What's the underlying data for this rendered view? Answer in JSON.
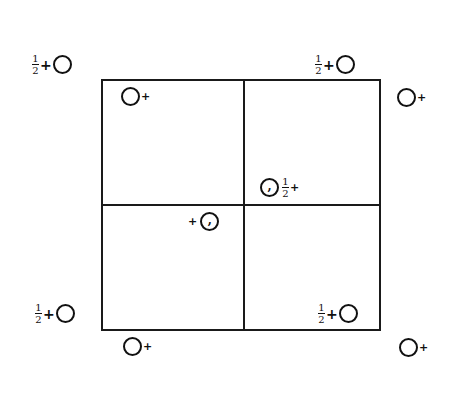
{
  "diagram": {
    "cell": {
      "x": 101,
      "y": 80,
      "width": 279,
      "height": 250,
      "divider_x": 243,
      "divider_y": 205
    },
    "symbols": [
      {
        "id": "tl-outer",
        "fraction": {
          "num": "1",
          "den": "2"
        },
        "sign": "+",
        "comma": false,
        "order": "frac-sign-circle"
      },
      {
        "id": "tl-inner",
        "sign": "+",
        "comma": false,
        "order": "circle-sign"
      },
      {
        "id": "tr-top",
        "fraction": {
          "num": "1",
          "den": "2"
        },
        "sign": "+",
        "comma": false,
        "order": "frac-sign-circle"
      },
      {
        "id": "tr-outer",
        "sign": "+",
        "comma": false,
        "order": "circle-sign"
      },
      {
        "id": "center-upper",
        "fraction": {
          "num": "1",
          "den": "2"
        },
        "sign": "+",
        "comma": true,
        "comma_glyph": ",",
        "order": "circle-frac-sign"
      },
      {
        "id": "center-lower",
        "sign": "+",
        "comma": true,
        "comma_glyph": ",",
        "order": "sign-circle"
      },
      {
        "id": "bl-outer",
        "fraction": {
          "num": "1",
          "den": "2"
        },
        "sign": "+",
        "comma": false,
        "order": "frac-sign-circle"
      },
      {
        "id": "bl-below",
        "sign": "+",
        "comma": false,
        "order": "circle-sign"
      },
      {
        "id": "br-inner",
        "fraction": {
          "num": "1",
          "den": "2"
        },
        "sign": "+",
        "comma": false,
        "order": "frac-sign-circle"
      },
      {
        "id": "br-outer",
        "sign": "+",
        "comma": false,
        "order": "circle-sign"
      }
    ]
  }
}
